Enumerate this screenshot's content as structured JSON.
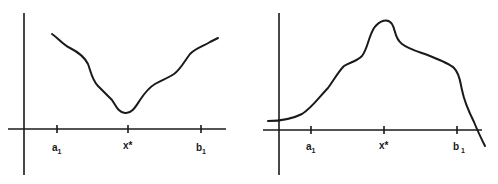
{
  "figure": {
    "panels": [
      {
        "id": "left",
        "description": "Function with a minimum at x* within interval [a1, b1]",
        "ticks": [
          {
            "label": "a",
            "subscript": "1"
          },
          {
            "label": "x*",
            "subscript": ""
          },
          {
            "label": "b",
            "subscript": "1"
          }
        ]
      },
      {
        "id": "right",
        "description": "Function with a maximum at x* within interval [a1, b1]",
        "ticks": [
          {
            "label": "a",
            "subscript": "1"
          },
          {
            "label": "x*",
            "subscript": ""
          },
          {
            "label": "b",
            "subscript": "1"
          }
        ]
      }
    ]
  },
  "colors": {
    "ink": "#1a1a1a",
    "background": "#ffffff"
  }
}
